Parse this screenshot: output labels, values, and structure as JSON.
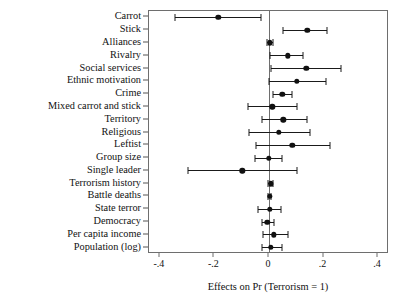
{
  "chart_data": {
    "type": "scatter",
    "subtype": "coefficient-plot-with-error-bars",
    "title": "",
    "xlabel": "Effects on Pr (Terrorism = 1)",
    "ylabel": "",
    "xlim": [
      -0.44,
      0.44
    ],
    "xticks": [
      -0.4,
      -0.2,
      0,
      0.2,
      0.4
    ],
    "xticklabels": [
      "-.4",
      "-.2",
      "0",
      ".2",
      ".4"
    ],
    "grid": false,
    "legend": null,
    "reference_line": 0,
    "categories": [
      "Carrot",
      "Stick",
      "Alliances",
      "Rivalry",
      "Social services",
      "Ethnic motivation",
      "Crime",
      "Mixed carrot and stick",
      "Territory",
      "Religious",
      "Leftist",
      "Group size",
      "Single leader",
      "Terrorism history",
      "Battle deaths",
      "State terror",
      "Democracy",
      "Per capita income",
      "Population (log)"
    ],
    "points": [
      {
        "label": "Carrot",
        "value": -0.186,
        "ci_low": -0.345,
        "ci_high": -0.031
      },
      {
        "label": "Stick",
        "value": 0.14,
        "ci_low": 0.052,
        "ci_high": 0.214
      },
      {
        "label": "Alliances",
        "value": 0.003,
        "ci_low": -0.009,
        "ci_high": 0.015
      },
      {
        "label": "Rivalry",
        "value": 0.07,
        "ci_low": 0.003,
        "ci_high": 0.125
      },
      {
        "label": "Social services",
        "value": 0.137,
        "ci_low": 0.006,
        "ci_high": 0.263
      },
      {
        "label": "Ethnic motivation",
        "value": 0.101,
        "ci_low": 0.0,
        "ci_high": 0.208
      },
      {
        "label": "Crime",
        "value": 0.049,
        "ci_low": 0.015,
        "ci_high": 0.086
      },
      {
        "label": "Mixed carrot and stick",
        "value": 0.012,
        "ci_low": -0.076,
        "ci_high": 0.101
      },
      {
        "label": "Territory",
        "value": 0.052,
        "ci_low": -0.027,
        "ci_high": 0.14
      },
      {
        "label": "Religious",
        "value": 0.037,
        "ci_low": -0.073,
        "ci_high": 0.15
      },
      {
        "label": "Leftist",
        "value": 0.086,
        "ci_low": -0.046,
        "ci_high": 0.223
      },
      {
        "label": "Group size",
        "value": 0.0,
        "ci_low": -0.052,
        "ci_high": 0.049
      },
      {
        "label": "Single leader",
        "value": -0.098,
        "ci_low": -0.296,
        "ci_high": 0.101
      },
      {
        "label": "Terrorism history",
        "value": 0.006,
        "ci_low": -0.003,
        "ci_high": 0.015
      },
      {
        "label": "Battle deaths",
        "value": 0.003,
        "ci_low": -0.003,
        "ci_high": 0.009
      },
      {
        "label": "State terror",
        "value": 0.003,
        "ci_low": -0.04,
        "ci_high": 0.043
      },
      {
        "label": "Democracy",
        "value": -0.006,
        "ci_low": -0.027,
        "ci_high": 0.018
      },
      {
        "label": "Per capita income",
        "value": 0.018,
        "ci_low": -0.021,
        "ci_high": 0.07
      },
      {
        "label": "Population (log)",
        "value": 0.006,
        "ci_low": -0.024,
        "ci_high": 0.046
      }
    ]
  }
}
